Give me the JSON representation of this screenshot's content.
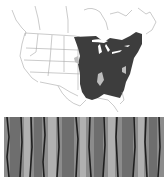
{
  "figure": {
    "map": {
      "region": "North America",
      "range_label": "native range",
      "range_color": "#3a3a3a",
      "border_color": "#9a9a9a",
      "land_color": "#ffffff"
    },
    "bark_photo": {
      "subject": "tree bark",
      "tone": "grayscale"
    }
  }
}
